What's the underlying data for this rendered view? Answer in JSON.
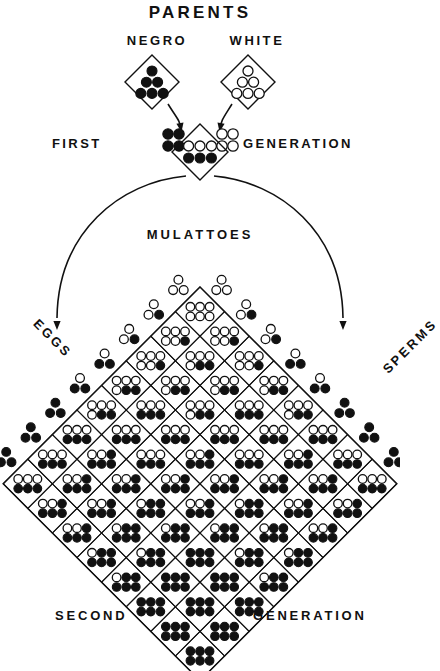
{
  "title": "PARENTS",
  "labels": {
    "parents": "PARENTS",
    "parent_left": "NEGRO",
    "parent_right": "WHITE",
    "first_left": "FIRST",
    "first_right": "GENERATION",
    "mulattoes": "MULATTOES",
    "eggs": "EGGS",
    "sperms": "SPERMS",
    "second_left": "SECOND",
    "second_right": "GENERATION"
  },
  "colors": {
    "ink": "#111111",
    "paper": "#ffffff",
    "dot_black": "#111111",
    "dot_white": "#ffffff"
  },
  "chart_data": {
    "type": "diagram",
    "subtitle": "PARENTS: NEGRO x WHITE -> FIRST GENERATION MULATTOES -> SECOND GENERATION",
    "legend": [
      {
        "name": "black-dot",
        "meaning": "pigment (dominant) factor",
        "color": "#111111"
      },
      {
        "name": "white-dot",
        "meaning": "non-pigment factor",
        "color": "#ffffff"
      }
    ],
    "parents": [
      {
        "name": "NEGRO",
        "dots_total": 6,
        "black": 6,
        "white": 0,
        "rows": [
          [
            1,
            1,
            1
          ],
          [
            1,
            1,
            1
          ]
        ]
      },
      {
        "name": "WHITE",
        "dots_total": 6,
        "black": 0,
        "white": 6,
        "rows": [
          [
            0,
            0,
            0
          ],
          [
            0,
            0,
            0
          ]
        ]
      }
    ],
    "first_generation": {
      "name": "MULATTOES",
      "cell": {
        "dots_total": 6,
        "black": 3,
        "white": 3,
        "rows": [
          [
            0,
            0,
            0
          ],
          [
            1,
            1,
            1
          ]
        ]
      },
      "egg_cluster": {
        "black": 3,
        "white": 0
      },
      "sperm_cluster": {
        "black": 0,
        "white": 3
      }
    },
    "gametes": {
      "count_per_side": 8,
      "dots_per_gamete": 3,
      "eggs_black_counts": [
        0,
        1,
        1,
        2,
        2,
        3,
        3,
        3
      ],
      "sperms_black_counts": [
        0,
        1,
        1,
        2,
        2,
        3,
        3,
        3
      ],
      "note": "gametes range from all-white (apex) to all-black (outer corners)"
    },
    "punnett": {
      "rows": 8,
      "cols": 8,
      "dots_per_cell": 6,
      "black_counts": [
        [
          0,
          1,
          1,
          2,
          2,
          3,
          3,
          3
        ],
        [
          1,
          2,
          2,
          3,
          3,
          4,
          4,
          4
        ],
        [
          1,
          2,
          2,
          3,
          3,
          4,
          4,
          4
        ],
        [
          2,
          3,
          3,
          4,
          4,
          5,
          5,
          5
        ],
        [
          2,
          3,
          3,
          4,
          4,
          5,
          5,
          5
        ],
        [
          3,
          4,
          4,
          5,
          5,
          6,
          6,
          6
        ],
        [
          3,
          4,
          4,
          5,
          5,
          6,
          6,
          6
        ],
        [
          3,
          4,
          4,
          5,
          5,
          6,
          6,
          6
        ]
      ],
      "xlabel": "SPERMS",
      "ylabel": "EGGS"
    },
    "arrows": [
      {
        "from": "NEGRO",
        "to": "FIRST GENERATION"
      },
      {
        "from": "WHITE",
        "to": "FIRST GENERATION"
      },
      {
        "from": "FIRST GENERATION",
        "to": "EGGS"
      },
      {
        "from": "FIRST GENERATION",
        "to": "SPERMS"
      }
    ]
  }
}
